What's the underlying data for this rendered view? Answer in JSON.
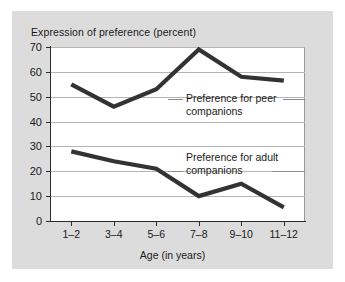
{
  "figure": {
    "background_color": "#dcdcdc",
    "plot_background_color": "#ffffff",
    "line_color": "#333333",
    "grid_color": "#b4b4b4",
    "axis_color": "#2b2b2b"
  },
  "chart_data": {
    "type": "line",
    "title": "Expression of preference (percent)",
    "xlabel": "Age (in years)",
    "ylabel": "",
    "categories": [
      "1–2",
      "3–4",
      "5–6",
      "7–8",
      "9–10",
      "11–12"
    ],
    "ylim": [
      0,
      70
    ],
    "yticks": [
      0,
      10,
      20,
      30,
      40,
      50,
      60,
      70
    ],
    "ytick_labels": [
      "0",
      "10",
      "20",
      "30",
      "40",
      "50",
      "60",
      "70"
    ],
    "grid": true,
    "legend": "annotations-inline",
    "series": [
      {
        "name": "Preference for peer companions",
        "values": [
          55,
          46,
          53,
          69,
          58,
          56.5
        ],
        "annotation": "Preference for peer\ncompanions"
      },
      {
        "name": "Preference for adult companions",
        "values": [
          28,
          24,
          21,
          10,
          15,
          5.5
        ],
        "annotation": "Preference for adult\ncompanions"
      }
    ]
  }
}
